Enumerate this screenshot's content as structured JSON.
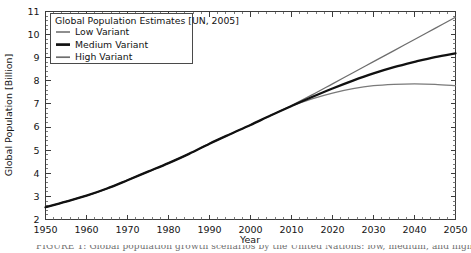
{
  "chart_data": {
    "type": "line",
    "title": "",
    "xlabel": "Year",
    "ylabel": "Global Population [Billion]",
    "xlim": [
      1950,
      2050
    ],
    "ylim": [
      2,
      11
    ],
    "xticks": [
      1950,
      1960,
      1970,
      1980,
      1990,
      2000,
      2010,
      2020,
      2030,
      2040,
      2050
    ],
    "yticks": [
      2,
      3,
      4,
      5,
      6,
      7,
      8,
      9,
      10,
      11
    ],
    "grid": false,
    "legend_position": "upper-left",
    "legend_title": "Global Population Estimates [UN, 2005]",
    "x": [
      1950,
      1955,
      1960,
      1965,
      1970,
      1975,
      1980,
      1985,
      1990,
      1995,
      2000,
      2005,
      2010,
      2015,
      2020,
      2025,
      2030,
      2035,
      2040,
      2045,
      2050
    ],
    "series": [
      {
        "name": "Low Variant",
        "color": "#7a7a7a",
        "width": 1.3,
        "values": [
          2.53,
          2.77,
          3.03,
          3.34,
          3.7,
          4.07,
          4.44,
          4.84,
          5.28,
          5.69,
          6.09,
          6.51,
          6.91,
          7.22,
          7.47,
          7.66,
          7.79,
          7.85,
          7.87,
          7.85,
          7.79
        ]
      },
      {
        "name": "Medium Variant",
        "color": "#111111",
        "width": 2.3,
        "values": [
          2.53,
          2.77,
          3.03,
          3.34,
          3.7,
          4.07,
          4.44,
          4.84,
          5.28,
          5.69,
          6.09,
          6.51,
          6.91,
          7.3,
          7.67,
          8.01,
          8.32,
          8.59,
          8.82,
          9.03,
          9.19
        ]
      },
      {
        "name": "High Variant",
        "color": "#6e6e6e",
        "width": 1.3,
        "values": [
          2.53,
          2.77,
          3.03,
          3.34,
          3.7,
          4.07,
          4.44,
          4.84,
          5.28,
          5.69,
          6.09,
          6.51,
          6.93,
          7.39,
          7.87,
          8.35,
          8.83,
          9.31,
          9.79,
          10.27,
          10.75
        ]
      }
    ]
  },
  "legend": {
    "title": "Global Population Estimates [UN, 2005]",
    "entries": [
      {
        "label": "Low Variant"
      },
      {
        "label": "Medium Variant"
      },
      {
        "label": "High Variant"
      }
    ]
  },
  "caption": {
    "text": "FIGURE 1: Global population growth scenarios by the United Nations: low, medium, and high variant"
  }
}
